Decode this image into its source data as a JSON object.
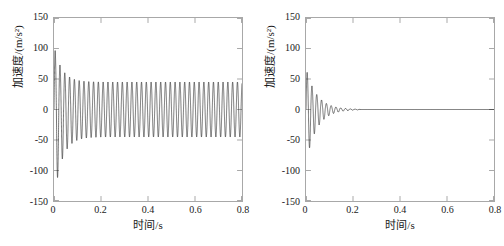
{
  "figure": {
    "background": "#ffffff",
    "line_color": "#1a1a1a",
    "axis_color": "#a8a8a8",
    "panel_count": 2
  },
  "chart_data": [
    {
      "type": "line",
      "title": "",
      "panel": "left",
      "xlabel": "时间/s",
      "ylabel": "加速度/(m/s²)",
      "xlim": [
        0,
        0.8
      ],
      "ylim": [
        -150,
        150
      ],
      "xticks": [
        0,
        0.2,
        0.4,
        0.6,
        0.8
      ],
      "xticklabels": [
        "0",
        "0.2",
        "0.4",
        "0.6",
        "0.8"
      ],
      "yticks": [
        -150,
        -100,
        -50,
        0,
        50,
        100,
        150
      ],
      "yticklabels": [
        "-150",
        "-100",
        "-50",
        "0",
        "50",
        "100",
        "150"
      ],
      "grid": false,
      "legend": null,
      "series": [
        {
          "name": "加速度",
          "description": "Transient start with large spike reaching about +105 and -150 near t=0, decaying within about 0.1 s into a sustained steady-state oscillation of roughly +45 / -45 m/s² lasting to t=0.8 s",
          "carrier_frequency_hz": 49,
          "steady_amplitude": 45,
          "initial_peak_positive": 105,
          "initial_peak_negative": -150,
          "transient_decay_time_s": 0.1
        }
      ]
    },
    {
      "type": "line",
      "title": "",
      "panel": "right",
      "xlabel": "时间/s",
      "ylabel": "加速度/(m/s²)",
      "xlim": [
        0,
        0.8
      ],
      "ylim": [
        -150,
        150
      ],
      "xticks": [
        0,
        0.2,
        0.4,
        0.6,
        0.8
      ],
      "xticklabels": [
        "0",
        "0.2",
        "0.4",
        "0.6",
        "0.8"
      ],
      "yticks": [
        -150,
        -100,
        -50,
        0,
        50,
        100,
        150
      ],
      "yticklabels": [
        "-150",
        "-100",
        "-50",
        "0",
        "50",
        "100",
        "150"
      ],
      "grid": false,
      "legend": null,
      "series": [
        {
          "name": "加速度",
          "description": "Damped oscillation beginning at about +68 / -88 m/s² at t=0 and decaying exponentially to essentially zero by t≈0.23 s, then flat at 0 through t=0.8 s",
          "carrier_frequency_hz": 49,
          "initial_peak_positive": 68,
          "initial_peak_negative": -88,
          "decay_time_constant_s": 0.045,
          "settle_time_s": 0.23
        }
      ]
    }
  ]
}
